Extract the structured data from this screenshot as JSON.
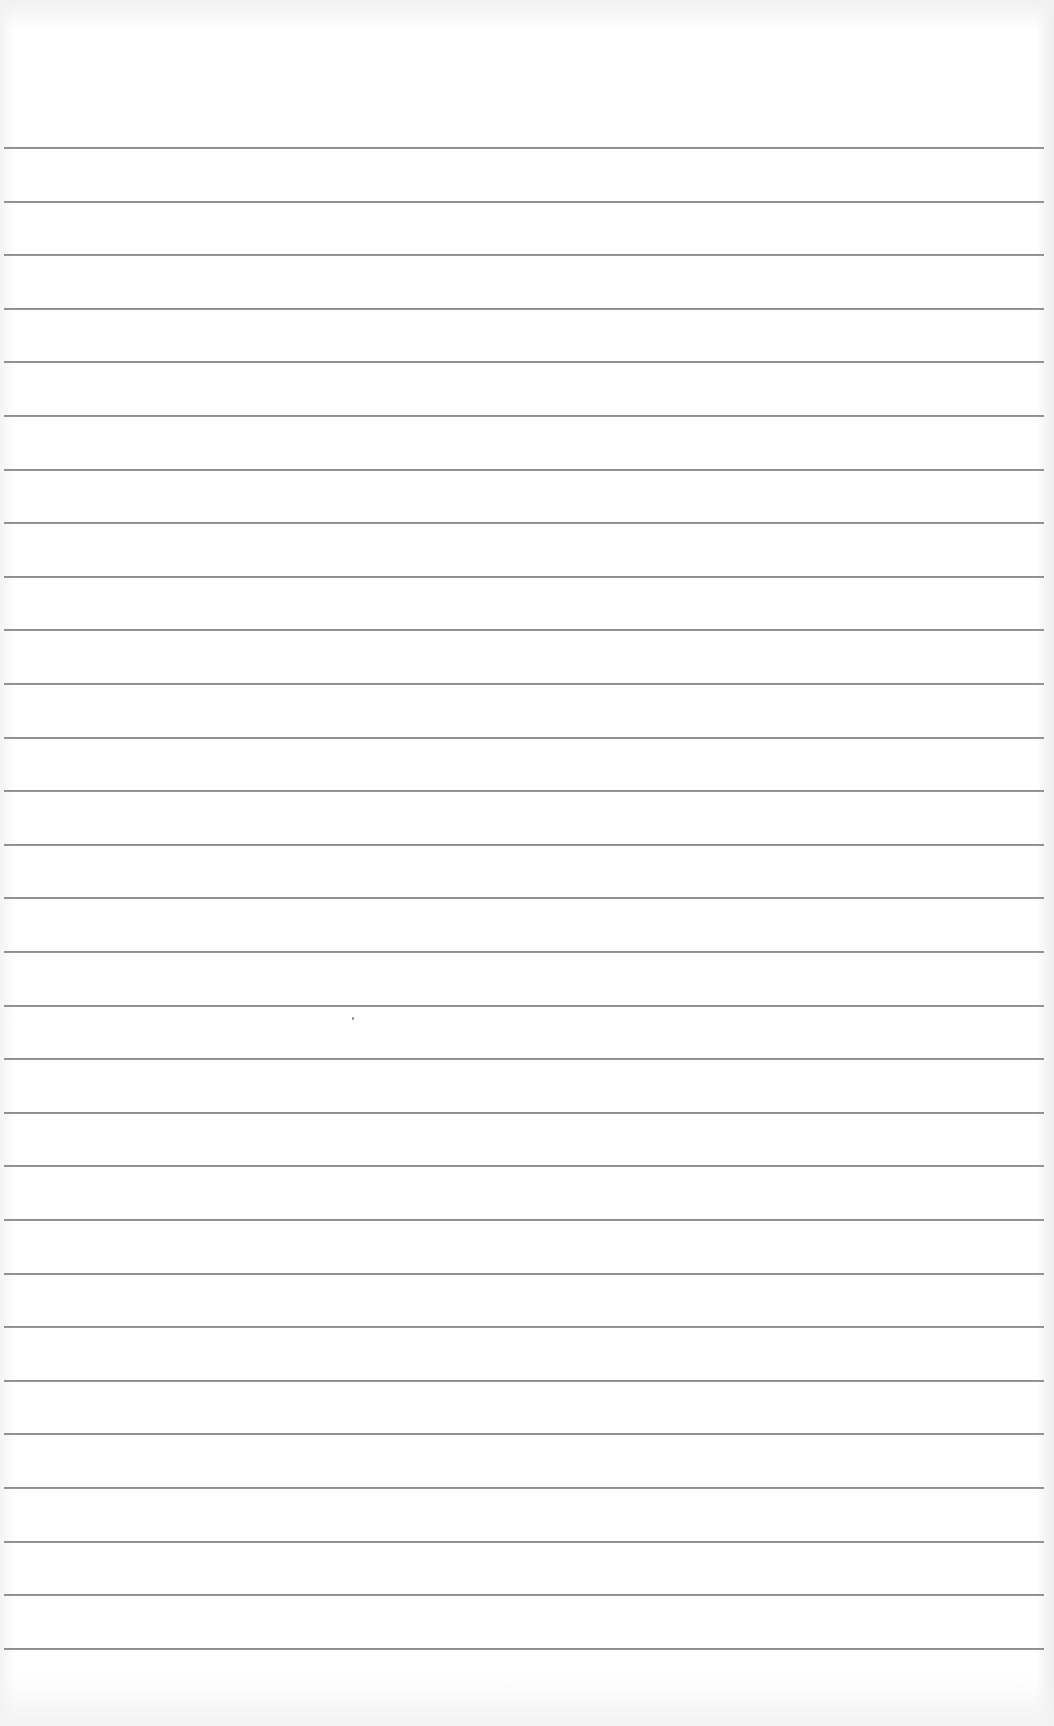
{
  "page": {
    "type": "lined-paper",
    "background_color": "#ffffff",
    "rule_color": "#8e8e8e",
    "rule_count": 29,
    "first_rule_y": 147,
    "rule_spacing_px": 53.6,
    "rule_left_x": 4,
    "rule_right_x": 1044
  }
}
